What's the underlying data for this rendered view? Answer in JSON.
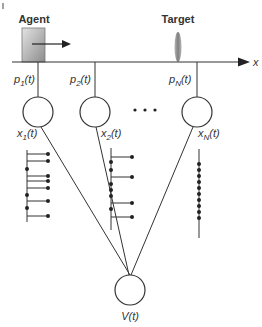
{
  "diagram": {
    "title": "",
    "agent": {
      "label": "Agent",
      "color_light": "#d9d9d9",
      "color_dark": "#8a8a8a"
    },
    "target": {
      "label": "Target",
      "color": "#9a9a9a"
    },
    "axis": {
      "label": "x"
    },
    "neurons": [
      {
        "position_label": "p1(t)",
        "p_main": "p",
        "p_sub": "1",
        "p_arg": "(t)",
        "output_main": "x",
        "output_sub": "1",
        "output_arg": "(t)"
      },
      {
        "position_label": "p2(t)",
        "p_main": "p",
        "p_sub": "2",
        "p_arg": "(t)",
        "output_main": "x",
        "output_sub": "2",
        "output_arg": "(t)"
      },
      {
        "position_label": "pN(t)",
        "p_main": "p",
        "p_sub": "N",
        "p_arg": "(t)",
        "output_main": "x",
        "output_sub": "N",
        "output_arg": "(t)"
      }
    ],
    "ellipsis": "• • •",
    "readout": {
      "label": "V(t)"
    },
    "colors": {
      "line": "#333333",
      "dot": "#222222",
      "background": "#ffffff"
    }
  }
}
